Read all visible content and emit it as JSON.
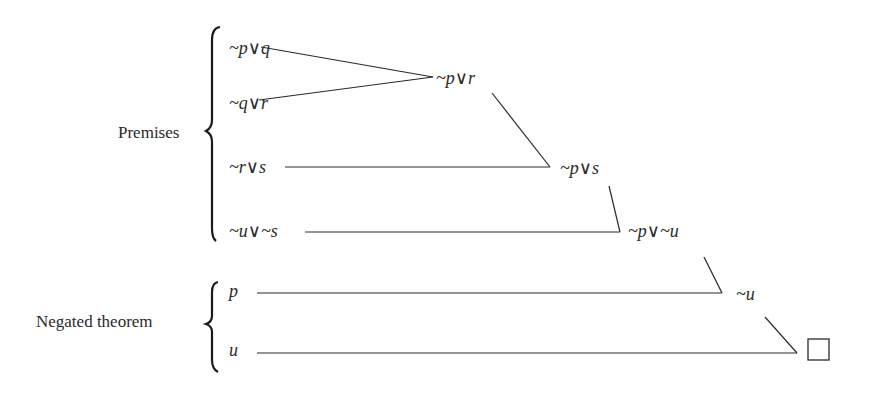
{
  "diagram": {
    "type": "resolution-refutation-tree",
    "groups": {
      "premises": {
        "label": "Premises"
      },
      "negated_theorem": {
        "label": "Negated theorem"
      }
    },
    "clauses": {
      "c1": {
        "text": "~p∨q"
      },
      "c2": {
        "text": "~q∨r"
      },
      "c3": {
        "text": "~r∨s"
      },
      "c4": {
        "text": "~u∨~s"
      },
      "c5": {
        "text": "p"
      },
      "c6": {
        "text": "u"
      }
    },
    "resolvents": {
      "r1": {
        "text": "~p∨r",
        "parents": [
          "c1",
          "c2"
        ]
      },
      "r2": {
        "text": "~p∨s",
        "parents": [
          "r1",
          "c3"
        ]
      },
      "r3": {
        "text": "~p∨~u",
        "parents": [
          "r2",
          "c4"
        ]
      },
      "r4": {
        "text": "~u",
        "parents": [
          "r3",
          "c5"
        ]
      },
      "r5": {
        "text": "□",
        "parents": [
          "r4",
          "c6"
        ],
        "meaning": "empty clause"
      }
    }
  }
}
